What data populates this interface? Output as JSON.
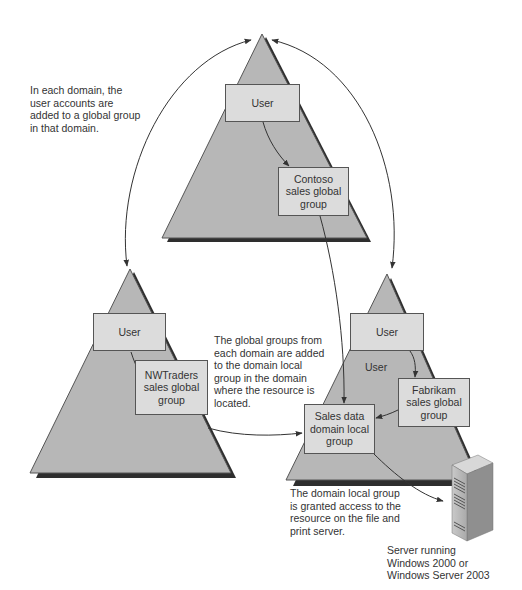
{
  "colors": {
    "triangle_fill": "#b7b7b7",
    "triangle_edge": "#555555",
    "shadow": "#2e2e2e",
    "box_fill": "#dcdcdc",
    "box_border": "#555555",
    "arrow": "#333333"
  },
  "domains": [
    {
      "name": "Contoso",
      "user_box": "User",
      "global_group_box": "Contoso\nsales global\ngroup"
    },
    {
      "name": "NWTraders",
      "user_box": "User",
      "global_group_box": "NWTraders\nsales global\ngroup"
    },
    {
      "name": "Fabrikam",
      "user_box": "User",
      "extra_user_label": "User",
      "global_group_box": "Fabrikam\nsales global\ngroup",
      "domain_local_group_box": "Sales data\ndomain local\ngroup"
    }
  ],
  "annotations": {
    "user_accounts_note": "In each domain, the\nuser accounts are\nadded to a global group\nin that domain.",
    "global_groups_note": "The global groups from\neach domain are added\nto the domain local\ngroup in the domain\nwhere the resource is\nlocated.",
    "domain_local_note": "The domain local group\nis granted access to the\nresource on the file and\nprint server.",
    "server_caption": "Server running\nWindows 2000 or\nWindows Server 2003"
  },
  "icons": {
    "server": "server-tower-icon"
  }
}
